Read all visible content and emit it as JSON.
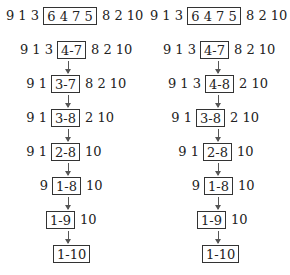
{
  "diagram": {
    "columns": [
      {
        "name": "left",
        "rows": [
          {
            "pre": "9 1 3",
            "box": "6 4 7 5",
            "post": "8 2 10"
          },
          {
            "pre": "9 1 3",
            "box": "4-7",
            "post": "8 2 10"
          },
          {
            "pre": "9 1",
            "box": "3-7",
            "post": "8 2 10"
          },
          {
            "pre": "9 1",
            "box": "3-8",
            "post": "2 10"
          },
          {
            "pre": "9 1",
            "box": "2-8",
            "post": "10"
          },
          {
            "pre": "9",
            "box": "1-8",
            "post": "10"
          },
          {
            "pre": "",
            "box": "1-9",
            "post": "10"
          },
          {
            "pre": "",
            "box": "1-10",
            "post": ""
          }
        ]
      },
      {
        "name": "right",
        "rows": [
          {
            "pre": "9 1 3",
            "box": "6 4 7 5",
            "post": "8 2 10"
          },
          {
            "pre": "9 1 3",
            "box": "4-7",
            "post": "8 2 10"
          },
          {
            "pre": "9 1 3",
            "box": "4-8",
            "post": "2 10"
          },
          {
            "pre": "9 1",
            "box": "3-8",
            "post": "2 10"
          },
          {
            "pre": "9 1",
            "box": "2-8",
            "post": "10"
          },
          {
            "pre": "9",
            "box": "1-8",
            "post": "10"
          },
          {
            "pre": "",
            "box": "1-9",
            "post": "10"
          },
          {
            "pre": "",
            "box": "1-10",
            "post": ""
          }
        ]
      }
    ],
    "arrow_icon": "down-arrow-icon"
  }
}
